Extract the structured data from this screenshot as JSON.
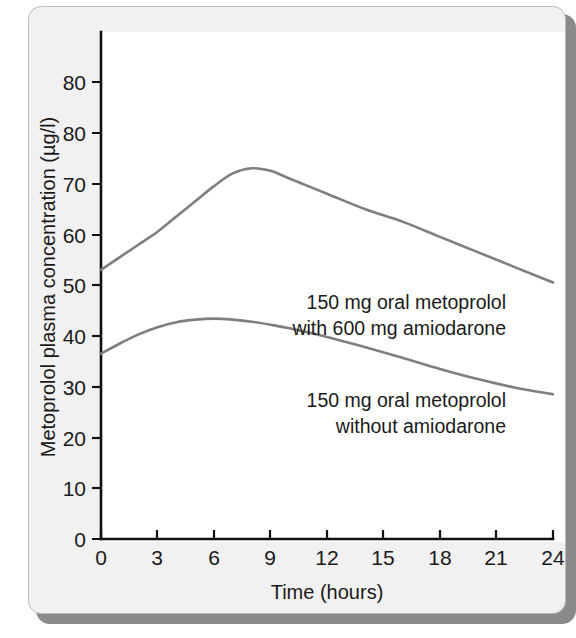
{
  "chart_data": {
    "type": "line",
    "title": "",
    "subtitle": "",
    "xlabel": "Time (hours)",
    "ylabel": "Metoprolol plasma concentration (µg/l)",
    "xlim": [
      0,
      24
    ],
    "ylim": [
      0,
      90
    ],
    "grid": false,
    "legend_position": "inline-annotations",
    "x_ticks": [
      0,
      3,
      6,
      9,
      12,
      15,
      18,
      21,
      24
    ],
    "x_tick_labels": [
      "0",
      "3",
      "6",
      "9",
      "12",
      "15",
      "18",
      "21",
      "24"
    ],
    "y_ticks": [
      0,
      10,
      20,
      30,
      40,
      50,
      60,
      70,
      80,
      90
    ],
    "y_tick_labels": [
      "0",
      "10",
      "20",
      "30",
      "40",
      "50",
      "60",
      "70",
      "80",
      "80"
    ],
    "y_tick_label_note": "Top tick is printed as 80 in the original figure (duplicate of the 80 below it)",
    "line_color": "#7f7f7f",
    "axis_color": "#111111",
    "series": [
      {
        "name": "150 mg oral metoprolol with 600 mg amiodarone",
        "x": [
          0,
          1,
          2,
          3,
          4,
          5,
          6,
          7,
          8,
          9,
          10,
          12,
          14,
          16,
          18,
          20,
          22,
          24
        ],
        "values": [
          53,
          55.5,
          58,
          60.5,
          63.5,
          66.5,
          69.5,
          72,
          73,
          72.5,
          71,
          68,
          65,
          62.5,
          59.5,
          56.5,
          53.5,
          50.5
        ]
      },
      {
        "name": "150 mg oral metoprolol without amiodarone",
        "x": [
          0,
          1,
          2,
          3,
          4,
          5,
          6,
          7,
          8,
          9,
          10,
          12,
          14,
          16,
          18,
          20,
          22,
          24
        ],
        "values": [
          36.5,
          38.5,
          40.3,
          41.7,
          42.7,
          43.2,
          43.4,
          43.2,
          42.8,
          42.2,
          41.5,
          39.8,
          37.8,
          35.7,
          33.5,
          31.5,
          29.8,
          28.5
        ]
      }
    ],
    "annotations": [
      {
        "id": "annotation-with-amiodarone",
        "lines": [
          "150 mg oral metoprolol",
          "with 600 mg amiodarone"
        ],
        "x_data": 21.5,
        "y_data": 46
      },
      {
        "id": "annotation-without-amiodarone",
        "lines": [
          "150 mg oral metoprolol",
          "without amiodarone"
        ],
        "x_data": 21.5,
        "y_data": 24
      }
    ]
  },
  "colors": {
    "panel_background": "#f1f1f1",
    "plot_background": "#ffffff",
    "panel_border": "#bdbdbd",
    "shadow": "#8a8a8a",
    "curve": "#7f7f7f",
    "text": "#1a1a1a"
  }
}
